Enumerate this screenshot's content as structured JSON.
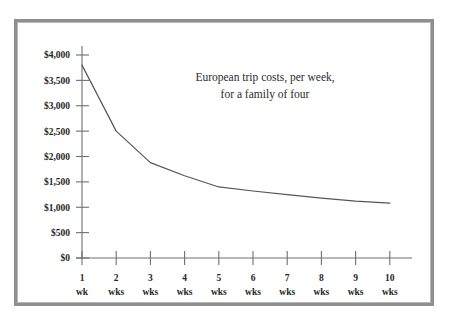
{
  "figure": {
    "frame_color": "#8e8e8e",
    "background": "#ffffff"
  },
  "chart_data": {
    "type": "line",
    "title": "European trip costs, per week,",
    "title_line2": "for a family of four",
    "subtitle": "",
    "xlabel": "",
    "ylabel": "",
    "categories": [
      "1 wk",
      "2 wks",
      "3 wks",
      "4 wks",
      "5 wks",
      "6 wks",
      "7 wks",
      "8 wks",
      "9 wks",
      "10 wks"
    ],
    "x": [
      1,
      2,
      3,
      4,
      5,
      6,
      7,
      8,
      9,
      10
    ],
    "values": [
      3800,
      2500,
      1880,
      1620,
      1400,
      1320,
      1250,
      1180,
      1120,
      1080
    ],
    "series": [
      {
        "name": "European trip costs per week",
        "values": [
          3800,
          2500,
          1880,
          1620,
          1400,
          1320,
          1250,
          1180,
          1120,
          1080
        ],
        "color": "#565656"
      }
    ],
    "ylim": [
      0,
      4000
    ],
    "ytick_values": [
      0,
      500,
      1000,
      1500,
      2000,
      2500,
      3000,
      3500,
      4000
    ],
    "ytick_labels": [
      "$0",
      "$500",
      "$1,000",
      "$1,500",
      "$2,000",
      "$2,500",
      "$3,000",
      "$3,500",
      "$4,000"
    ],
    "xtick_numbers": [
      "1",
      "2",
      "3",
      "4",
      "5",
      "6",
      "7",
      "8",
      "9",
      "10"
    ],
    "xtick_units": [
      "wk",
      "wks",
      "wks",
      "wks",
      "wks",
      "wks",
      "wks",
      "wks",
      "wks",
      "wks"
    ],
    "grid": false,
    "legend": false,
    "legend_position": "none"
  }
}
